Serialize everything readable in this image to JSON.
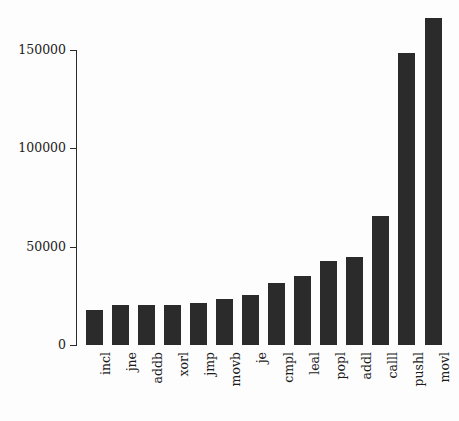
{
  "chart_data": {
    "type": "bar",
    "title": "",
    "subtitle": "",
    "xlabel": "",
    "ylabel": "",
    "categories": [
      "incl",
      "jne",
      "addb",
      "xorl",
      "jmp",
      "movb",
      "je",
      "cmpl",
      "leal",
      "popl",
      "addl",
      "calll",
      "pushl",
      "movl"
    ],
    "values": [
      17800,
      20400,
      20400,
      20400,
      21400,
      23400,
      25400,
      31500,
      35000,
      42700,
      44800,
      65600,
      148500,
      166500
    ],
    "ylim": [
      0,
      170000
    ],
    "yticks": [
      0,
      50000,
      100000,
      150000
    ],
    "ytick_labels": [
      "0",
      "50000",
      "100000",
      "150000"
    ],
    "grid": false,
    "legend": false,
    "legend_position": "none",
    "bar_color": "#2b2b2b",
    "background_color": "#fdfdfd",
    "axis_color": "#2b2b2b",
    "orientation": "vertical",
    "xtick_rotation": 90
  }
}
